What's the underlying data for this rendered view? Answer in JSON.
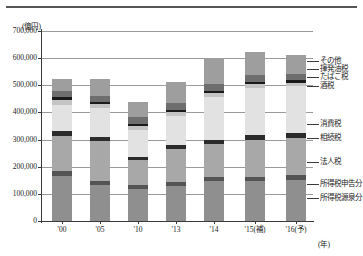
{
  "figure": {
    "unit_label": "(億円)",
    "x_axis_unit": "(年)"
  },
  "chart_data": {
    "type": "bar",
    "title": "",
    "subtitle": "",
    "xlabel": "(年)",
    "ylabel": "(億円)",
    "stacked": true,
    "grid": true,
    "legend_position": "right",
    "ylim": [
      0,
      700000
    ],
    "yticks": [
      0,
      100000,
      200000,
      300000,
      400000,
      500000,
      600000,
      700000
    ],
    "ytick_labels": [
      "0",
      "100,000",
      "200,000",
      "300,000",
      "400,000",
      "500,000",
      "600,000",
      "700,000"
    ],
    "categories": [
      "'00",
      "'05",
      "'10",
      "'13",
      "'14",
      "'15(補)",
      "'16(予)"
    ],
    "series": [
      {
        "name": "所得税源泉分",
        "color": "#8f8f8f",
        "values": [
          165000,
          132000,
          118000,
          128000,
          148000,
          147000,
          152000
        ]
      },
      {
        "name": "所得税申告分",
        "color": "#545454",
        "values": [
          18000,
          17000,
          15000,
          17000,
          15000,
          16000,
          18000
        ]
      },
      {
        "name": "法人税",
        "color": "#a8a8a8",
        "values": [
          130000,
          145000,
          90000,
          120000,
          120000,
          137000,
          135000
        ]
      },
      {
        "name": "相続税",
        "color": "#2b2b2b",
        "values": [
          18000,
          15000,
          12000,
          15000,
          15000,
          18000,
          21000
        ]
      },
      {
        "name": "消費税",
        "color": "#e2e2e2",
        "values": [
          98000,
          106000,
          100000,
          108000,
          160000,
          173000,
          171000
        ]
      },
      {
        "name": "酒税",
        "color": "#c4c4c4",
        "values": [
          18000,
          16000,
          14000,
          13000,
          13000,
          13000,
          13000
        ]
      },
      {
        "name": "たばこ税",
        "color": "#1a1a1a",
        "values": [
          9000,
          9000,
          9000,
          9000,
          9000,
          9000,
          9000
        ]
      },
      {
        "name": "揮発油税",
        "color": "#6e6e6e",
        "values": [
          22000,
          21000,
          26000,
          25000,
          25000,
          25000,
          24000
        ]
      },
      {
        "name": "その他",
        "color": "#9e9e9e",
        "values": [
          47000,
          61000,
          53000,
          76000,
          95000,
          84000,
          68000
        ]
      }
    ],
    "totals": [
      525000,
      522000,
      437000,
      511000,
      600000,
      622000,
      611000
    ]
  },
  "legend": {
    "items": [
      {
        "label": "その他"
      },
      {
        "label": "揮発油税"
      },
      {
        "label": "たばこ税"
      },
      {
        "label": "酒税"
      },
      {
        "label": "消費税"
      },
      {
        "label": "相続税"
      },
      {
        "label": "法人税"
      },
      {
        "label": "所得税申告分"
      },
      {
        "label": "所得税源泉分"
      }
    ]
  }
}
